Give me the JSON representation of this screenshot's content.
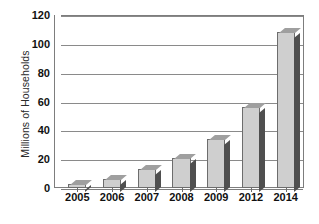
{
  "chart_data": {
    "type": "bar",
    "title": "",
    "subtitle": "",
    "xlabel": "",
    "ylabel": "Millions of Households",
    "categories": [
      "2005",
      "2006",
      "2007",
      "2008",
      "2009",
      "2012",
      "2014"
    ],
    "values": [
      3,
      6,
      13,
      21,
      34,
      56,
      108
    ],
    "series": [
      {
        "name": "Households",
        "values": [
          3,
          6,
          13,
          21,
          34,
          56,
          108
        ]
      }
    ],
    "ylim": [
      0,
      120
    ],
    "ytick_labels": [
      "0",
      "20",
      "40",
      "60",
      "80",
      "100",
      "120"
    ],
    "ytick_values": [
      0,
      20,
      40,
      60,
      80,
      100,
      120
    ],
    "grid": true,
    "legend": false,
    "legend_position": "none",
    "bar_style": "3d",
    "colors": {
      "bar_face": "#cfcfcf",
      "bar_side": "#4f4f4f",
      "bar_top": "#9f9f9f",
      "bar_outline": "#6d6d6d",
      "gridline": "#8a8a8a",
      "axis": "#7d7d7d",
      "text": "#111111",
      "plot_background": "#ffffff"
    }
  },
  "caption": {
    "source_text_cropped": ""
  }
}
